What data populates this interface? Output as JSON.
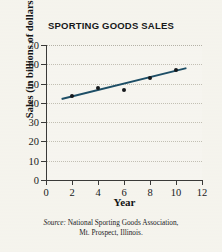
{
  "chart_data": {
    "type": "scatter",
    "title": "SPORTING GOODS SALES",
    "xlabel": "Year",
    "ylabel": "Sales (in billions of dollars)",
    "xlim": [
      0,
      12
    ],
    "ylim": [
      0,
      70
    ],
    "xticks": [
      0,
      2,
      4,
      6,
      8,
      10,
      12
    ],
    "yticks": [
      0,
      10,
      20,
      30,
      40,
      50,
      60,
      70
    ],
    "grid": "horizontal-dotted",
    "legend": "none",
    "x": [
      2,
      4,
      6,
      8,
      10
    ],
    "values": [
      43.5,
      47.5,
      46.5,
      53,
      57
    ],
    "points": [
      {
        "x": 2,
        "y": 43.5
      },
      {
        "x": 4,
        "y": 47.5
      },
      {
        "x": 6,
        "y": 46.5
      },
      {
        "x": 8,
        "y": 53
      },
      {
        "x": 10,
        "y": 57
      }
    ],
    "trendline": {
      "x1": 1.2,
      "y1": 42,
      "x2": 10.8,
      "y2": 58,
      "color": "#1d4e66"
    },
    "marker_color": "#15181c",
    "source_label": "Source:",
    "source_line1": "National Sporting Goods Association,",
    "source_line2": "Mt. Prospect, Illinois."
  }
}
